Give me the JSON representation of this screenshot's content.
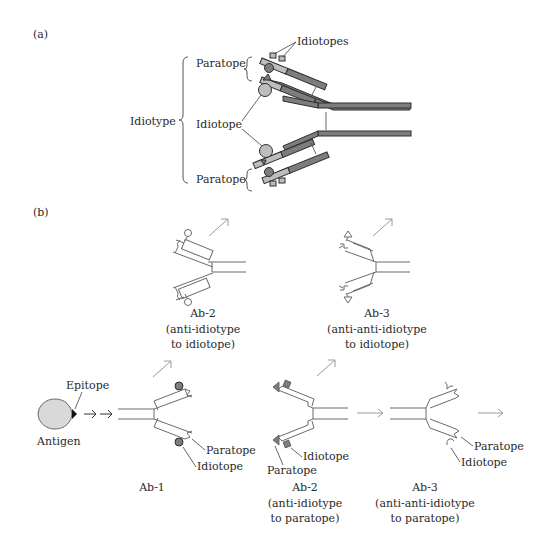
{
  "panel_a": {
    "label": "(a)",
    "labels": {
      "idiotypes_top": "Idiotopes",
      "paratope_top": "Paratope",
      "idiotope_mid": "Idiotope",
      "idiotype": "Idiotype",
      "paratope_bottom": "Paratope"
    }
  },
  "panel_b": {
    "label": "(b)",
    "antigen": {
      "label": "Antigen",
      "epitope_label": "Epitope"
    },
    "ab1": {
      "title": "Ab-1",
      "paratope_label": "Paratope",
      "idiotope_label": "Idiotope"
    },
    "ab2_idiotope": {
      "title": "Ab-2",
      "line2": "(anti-idiotype",
      "line3": "to idiotope)"
    },
    "ab3_idiotope": {
      "title": "Ab-3",
      "line2": "(anti-anti-idiotype",
      "line3": "to idiotope)"
    },
    "ab2_paratope": {
      "title": "Ab-2",
      "line2": "(anti-idiotype",
      "line3": "to paratope)",
      "paratope_label": "Paratope",
      "idiotope_label": "Idiotope"
    },
    "ab3_paratope": {
      "title": "Ab-3",
      "line2": "(anti-anti-idiotype",
      "line3": "to paratope)",
      "paratope_label": "Paratope",
      "idiotope_label": "Idiotope"
    }
  },
  "colors": {
    "heavy_chain": "#7d7d7d",
    "light_chain": "#bdbdbd",
    "antigen_fill": "#d9d9d9",
    "outline": "#6a6a6a"
  }
}
